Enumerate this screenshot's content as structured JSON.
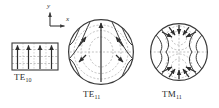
{
  "figure": {
    "background_color": "#ffffff",
    "line_color": "#3a3a3a",
    "dashed_color": "#9a9a9a",
    "width": 219,
    "height": 108
  },
  "axes_indicator": {
    "name": "coordinate-axes",
    "y_label": "y",
    "x_label": "x",
    "origin": {
      "x": 50,
      "y": 26
    },
    "y_tip": {
      "x": 50,
      "y": 11
    },
    "x_tip": {
      "x": 66,
      "y": 26
    }
  },
  "panels": [
    {
      "id": "te10",
      "label_text": "TE",
      "label_sub": "10",
      "shape": "rectangle",
      "guide": "rectangular",
      "bounds": {
        "x": 12,
        "y": 43,
        "width": 46,
        "height": 27
      },
      "e_field_arrows": 4,
      "e_field_direction": "vertical-up",
      "h_field_lines": "horizontal-dashed",
      "dashed_horizontal_count": 3,
      "dashed_vertical_count": 3
    },
    {
      "id": "te11",
      "label_text": "TE",
      "label_sub": "11",
      "shape": "circle",
      "guide": "circular",
      "center": {
        "x": 101,
        "y": 52
      },
      "radius": 33,
      "e_field_description": "curved solid lines bowing outward from vertical centerline with arrowheads pointing up and inward",
      "h_field_description": "dashed concentric ellipses and horizontal midline",
      "arrow_count": 5
    },
    {
      "id": "tm11",
      "label_text": "TM",
      "label_sub": "11",
      "shape": "circle",
      "guide": "circular",
      "center": {
        "x": 179,
        "y": 52
      },
      "radius": 29,
      "e_field_description": "arrows converging to focal points in upper and lower lobes",
      "h_field_description": "dashed oval lobes above and below horizontal midline",
      "arrow_count": 10
    }
  ],
  "legend": {
    "solid_line_meaning": "E field",
    "dashed_line_meaning": "H field"
  }
}
